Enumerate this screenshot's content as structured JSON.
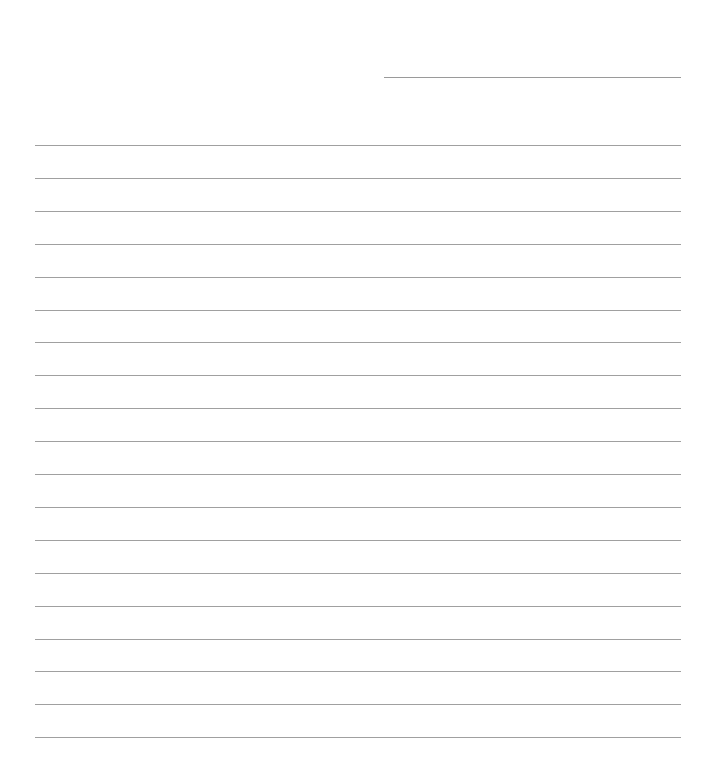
{
  "page": {
    "type": "blank lined paper",
    "header_line": {
      "label": ""
    },
    "lines": {
      "count": 19,
      "first_y": 145,
      "spacing": 32.9,
      "values": [
        "",
        "",
        "",
        "",
        "",
        "",
        "",
        "",
        "",
        "",
        "",
        "",
        "",
        "",
        "",
        "",
        "",
        "",
        ""
      ]
    },
    "colors": {
      "background": "#ffffff",
      "rule": "#a0a0a0"
    }
  }
}
